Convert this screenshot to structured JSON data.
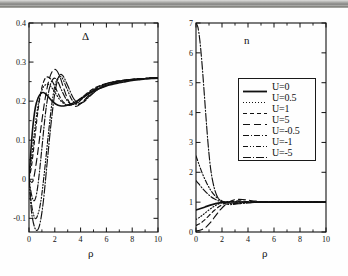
{
  "figure": {
    "background": "#fefefe",
    "ink": "#111111",
    "width": 348,
    "height": 276,
    "scan_artifact_top_band": true
  },
  "legend": {
    "position": "inside-right-panel-upper-middle",
    "border_color": "#1a1a1a",
    "entries": [
      {
        "label": "U=0",
        "style": "solid",
        "dash": "none"
      },
      {
        "label": "U=0.5",
        "style": "dotted",
        "dash": "1,2"
      },
      {
        "label": "U=1",
        "style": "dashed-short",
        "dash": "4,3"
      },
      {
        "label": "U=5",
        "style": "dashed-long",
        "dash": "7,4"
      },
      {
        "label": "U=-0.5",
        "style": "dash-dot",
        "dash": "6,2,1,2"
      },
      {
        "label": "U=-1",
        "style": "dash-dot-2",
        "dash": "5,2,1,2,1,2"
      },
      {
        "label": "U=-5",
        "style": "dash-dot-3",
        "dash": "8,2,1,2"
      }
    ]
  },
  "chart_data": [
    {
      "type": "line",
      "id": "delta-panel",
      "title": "Δ",
      "xlabel": "ρ",
      "ylabel": "",
      "xlim": [
        0,
        10
      ],
      "ylim": [
        -0.135,
        0.4
      ],
      "xticks": [
        0,
        2,
        4,
        6,
        8,
        10
      ],
      "xticklabels": [
        "0",
        "2",
        "4",
        "6",
        "8",
        "10"
      ],
      "xminorticks": [
        1,
        3,
        5,
        7,
        9
      ],
      "yticks": [
        -0.1,
        0,
        0.1,
        0.2,
        0.3,
        0.4
      ],
      "yticklabels": [
        "-0.1",
        "0",
        "0.1",
        "0.2",
        "0.3",
        "0.4"
      ],
      "yminorticks": [
        -0.05,
        0.05,
        0.15,
        0.25,
        0.35
      ],
      "grid": false,
      "asymptote": 0.26,
      "series": [
        {
          "name": "U=0",
          "style": "solid",
          "x": [
            0,
            0.15,
            0.3,
            0.5,
            0.7,
            0.9,
            1.1,
            1.3,
            1.5,
            1.8,
            2.1,
            2.4,
            2.8,
            3.2,
            3.6,
            4.0,
            4.5,
            5.0,
            5.5,
            6.0,
            6.5,
            7.0,
            7.5,
            8.0,
            8.5,
            9.0,
            9.5,
            10
          ],
          "y": [
            0.0,
            0.075,
            0.135,
            0.185,
            0.208,
            0.219,
            0.222,
            0.218,
            0.211,
            0.2,
            0.192,
            0.188,
            0.188,
            0.192,
            0.198,
            0.206,
            0.216,
            0.226,
            0.233,
            0.239,
            0.243,
            0.247,
            0.25,
            0.253,
            0.255,
            0.257,
            0.258,
            0.259
          ]
        },
        {
          "name": "U=0.5",
          "style": "dotted",
          "x": [
            0,
            0.2,
            0.4,
            0.6,
            0.8,
            1.0,
            1.2,
            1.5,
            1.8,
            2.1,
            2.4,
            2.7,
            3.0,
            3.4,
            3.8,
            4.2,
            4.6,
            5.0,
            5.5,
            6.0,
            6.5,
            7.0,
            7.5,
            8.0,
            9.0,
            10
          ],
          "y": [
            0.0,
            0.055,
            0.115,
            0.168,
            0.205,
            0.228,
            0.24,
            0.243,
            0.233,
            0.218,
            0.203,
            0.194,
            0.191,
            0.194,
            0.202,
            0.212,
            0.221,
            0.229,
            0.237,
            0.243,
            0.247,
            0.25,
            0.253,
            0.255,
            0.258,
            0.26
          ]
        },
        {
          "name": "U=1",
          "style": "dashed-short",
          "x": [
            0,
            0.2,
            0.4,
            0.6,
            0.8,
            1.0,
            1.2,
            1.4,
            1.7,
            2.0,
            2.3,
            2.6,
            3.0,
            3.4,
            3.8,
            4.2,
            4.6,
            5.0,
            5.5,
            6.0,
            6.5,
            7.0,
            7.5,
            8.0,
            9.0,
            10
          ],
          "y": [
            0.0,
            0.035,
            0.09,
            0.15,
            0.2,
            0.235,
            0.255,
            0.262,
            0.256,
            0.238,
            0.217,
            0.2,
            0.19,
            0.191,
            0.2,
            0.212,
            0.223,
            0.232,
            0.24,
            0.245,
            0.249,
            0.252,
            0.254,
            0.256,
            0.258,
            0.26
          ]
        },
        {
          "name": "U=5",
          "style": "dashed-long",
          "x": [
            0,
            0.3,
            0.6,
            0.9,
            1.2,
            1.5,
            1.8,
            2.1,
            2.4,
            2.7,
            3.0,
            3.3,
            3.7,
            4.1,
            4.5,
            5.0,
            5.5,
            6.0,
            6.5,
            7.0,
            7.5,
            8.0,
            9.0,
            10
          ],
          "y": [
            0.0,
            -0.005,
            0.05,
            0.125,
            0.196,
            0.248,
            0.276,
            0.28,
            0.262,
            0.232,
            0.205,
            0.19,
            0.187,
            0.196,
            0.21,
            0.226,
            0.237,
            0.244,
            0.249,
            0.252,
            0.254,
            0.256,
            0.258,
            0.26
          ]
        },
        {
          "name": "U=-0.5",
          "style": "dash-dot",
          "x": [
            0,
            0.2,
            0.4,
            0.6,
            0.8,
            1.0,
            1.3,
            1.6,
            1.9,
            2.2,
            2.5,
            2.9,
            3.3,
            3.7,
            4.1,
            4.5,
            5.0,
            5.5,
            6.0,
            6.5,
            7.0,
            7.5,
            8.0,
            9.0,
            10
          ],
          "y": [
            0.0,
            -0.04,
            -0.055,
            -0.035,
            0.015,
            0.08,
            0.175,
            0.235,
            0.258,
            0.252,
            0.23,
            0.204,
            0.192,
            0.194,
            0.205,
            0.217,
            0.23,
            0.239,
            0.245,
            0.249,
            0.252,
            0.254,
            0.256,
            0.258,
            0.26
          ]
        },
        {
          "name": "U=-1",
          "style": "dash-dot-2",
          "x": [
            0,
            0.2,
            0.4,
            0.6,
            0.9,
            1.2,
            1.5,
            1.8,
            2.1,
            2.5,
            2.9,
            3.3,
            3.7,
            4.1,
            4.5,
            5.0,
            5.5,
            6.0,
            6.5,
            7.0,
            7.5,
            8.0,
            9.0,
            10
          ],
          "y": [
            0.0,
            -0.065,
            -0.095,
            -0.098,
            -0.06,
            0.02,
            0.115,
            0.2,
            0.25,
            0.262,
            0.235,
            0.205,
            0.192,
            0.196,
            0.208,
            0.222,
            0.233,
            0.241,
            0.246,
            0.25,
            0.253,
            0.255,
            0.258,
            0.26
          ]
        },
        {
          "name": "U=-5",
          "style": "dash-dot-3",
          "x": [
            0,
            0.2,
            0.5,
            0.8,
            1.1,
            1.4,
            1.7,
            2.0,
            2.3,
            2.6,
            3.0,
            3.4,
            3.8,
            4.2,
            4.6,
            5.0,
            5.5,
            6.0,
            6.5,
            7.0,
            7.5,
            8.0,
            9.0,
            10
          ],
          "y": [
            0.0,
            -0.085,
            -0.128,
            -0.12,
            -0.06,
            0.04,
            0.14,
            0.22,
            0.262,
            0.266,
            0.24,
            0.21,
            0.195,
            0.197,
            0.209,
            0.221,
            0.233,
            0.241,
            0.246,
            0.25,
            0.253,
            0.255,
            0.258,
            0.26
          ]
        }
      ]
    },
    {
      "type": "line",
      "id": "n-panel",
      "title": "n",
      "xlabel": "ρ",
      "ylabel": "",
      "xlim": [
        0,
        10
      ],
      "ylim": [
        0,
        7
      ],
      "xticks": [
        0,
        2,
        4,
        6,
        8,
        10
      ],
      "xticklabels": [
        "0",
        "2",
        "4",
        "6",
        "8",
        "10"
      ],
      "xminorticks": [
        1,
        3,
        5,
        7,
        9
      ],
      "yticks": [
        0,
        1,
        2,
        3,
        4,
        5,
        6,
        7
      ],
      "yticklabels": [
        "0",
        "1",
        "2",
        "3",
        "4",
        "5",
        "6",
        "7"
      ],
      "grid": false,
      "asymptote": 1.0,
      "series": [
        {
          "name": "U=0",
          "style": "solid",
          "x": [
            0,
            0.3,
            0.7,
            1.1,
            1.5,
            1.9,
            2.3,
            2.8,
            3.3,
            4.0,
            5.0,
            6.0,
            7.0,
            8.0,
            9.0,
            10
          ],
          "y": [
            0.74,
            0.78,
            0.84,
            0.9,
            0.95,
            0.985,
            1.0,
            1.005,
            1.005,
            1.0,
            1.0,
            1.0,
            1.0,
            1.0,
            1.0,
            1.0
          ]
        },
        {
          "name": "U=0.5",
          "style": "dotted",
          "x": [
            0,
            0.3,
            0.6,
            1.0,
            1.4,
            1.8,
            2.2,
            2.6,
            3.0,
            3.6,
            4.2,
            5.0,
            6.0,
            7.0,
            8.0,
            9.0,
            10
          ],
          "y": [
            0.42,
            0.5,
            0.6,
            0.74,
            0.86,
            0.95,
            1.0,
            1.02,
            1.02,
            1.01,
            1.005,
            1.0,
            1.0,
            1.0,
            1.0,
            1.0,
            1.0
          ]
        },
        {
          "name": "U=1",
          "style": "dashed-short",
          "x": [
            0,
            0.3,
            0.6,
            1.0,
            1.4,
            1.8,
            2.2,
            2.6,
            3.0,
            3.5,
            4.0,
            4.6,
            5.2,
            6.0,
            7.0,
            8.0,
            9.0,
            10
          ],
          "y": [
            0.22,
            0.28,
            0.38,
            0.55,
            0.72,
            0.86,
            0.96,
            1.02,
            1.04,
            1.04,
            1.02,
            1.01,
            1.005,
            1.0,
            1.0,
            1.0,
            1.0,
            1.0
          ]
        },
        {
          "name": "U=5",
          "style": "dashed-long",
          "x": [
            0,
            0.3,
            0.7,
            1.1,
            1.5,
            1.9,
            2.3,
            2.7,
            3.1,
            3.6,
            4.1,
            4.7,
            5.4,
            6.2,
            7.0,
            8.0,
            9.0,
            10
          ],
          "y": [
            0.04,
            0.06,
            0.14,
            0.31,
            0.54,
            0.76,
            0.93,
            1.04,
            1.09,
            1.09,
            1.06,
            1.03,
            1.01,
            1.005,
            1.0,
            1.0,
            1.0,
            1.0
          ]
        },
        {
          "name": "U=-0.5",
          "style": "dash-dot",
          "x": [
            0,
            0.2,
            0.5,
            0.8,
            1.1,
            1.4,
            1.7,
            2.0,
            2.4,
            2.8,
            3.3,
            4.0,
            5.0,
            6.0,
            7.0,
            8.0,
            9.0,
            10
          ],
          "y": [
            1.72,
            1.62,
            1.46,
            1.32,
            1.2,
            1.11,
            1.05,
            1.01,
            0.98,
            0.97,
            0.98,
            0.99,
            1.0,
            1.0,
            1.0,
            1.0,
            1.0,
            1.0
          ]
        },
        {
          "name": "U=-1",
          "style": "dash-dot-2",
          "x": [
            0,
            0.2,
            0.5,
            0.8,
            1.1,
            1.4,
            1.7,
            2.0,
            2.4,
            2.8,
            3.3,
            4.0,
            5.0,
            6.0,
            7.0,
            8.0,
            9.0,
            10
          ],
          "y": [
            2.55,
            2.3,
            1.95,
            1.66,
            1.42,
            1.24,
            1.12,
            1.04,
            0.97,
            0.95,
            0.96,
            0.98,
            1.0,
            1.0,
            1.0,
            1.0,
            1.0,
            1.0
          ]
        },
        {
          "name": "U=-5",
          "style": "dash-dot-3",
          "x": [
            0,
            0.15,
            0.3,
            0.45,
            0.6,
            0.75,
            0.9,
            1.05,
            1.2,
            1.4,
            1.6,
            1.8,
            2.1,
            2.5,
            3.0,
            3.8,
            5.0,
            6.5,
            8.0,
            10
          ],
          "y": [
            7.0,
            6.85,
            6.4,
            5.7,
            4.85,
            3.95,
            3.1,
            2.4,
            1.9,
            1.48,
            1.22,
            1.08,
            0.97,
            0.92,
            0.93,
            0.97,
            1.0,
            1.0,
            1.0,
            1.0
          ]
        }
      ]
    }
  ]
}
